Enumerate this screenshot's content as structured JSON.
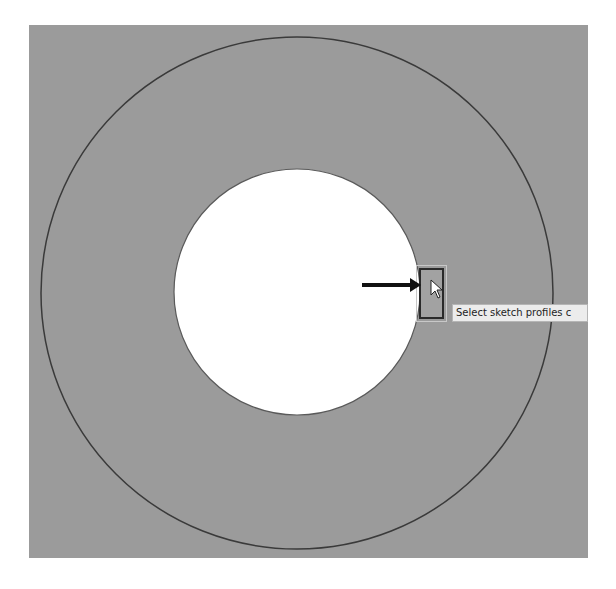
{
  "canvas": {
    "background": "#9b9b9b",
    "outer_circle": {
      "cx": 297,
      "cy": 293,
      "r": 256,
      "stroke": "#3a3a3a"
    },
    "inner_circle": {
      "cx": 297,
      "cy": 292,
      "r": 123,
      "fill": "#ffffff",
      "stroke": "#5a5a5a"
    }
  },
  "annotation": {
    "arrow": {
      "x1": 362,
      "y1": 285,
      "x2": 421,
      "y2": 285,
      "color": "#111111"
    }
  },
  "cursor": {
    "x": 431,
    "y": 280,
    "icon": "mouse-pointer-icon"
  },
  "tooltip": {
    "text": "Select sketch profiles c"
  }
}
